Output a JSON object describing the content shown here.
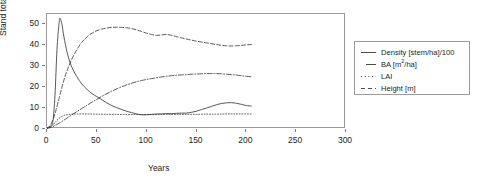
{
  "chart_data": {
    "type": "line",
    "title": "",
    "xlabel": "Years",
    "ylabel": "Stand totals",
    "xlim": [
      0,
      300
    ],
    "ylim": [
      0,
      55
    ],
    "grid": false,
    "legend_position": "right-outside",
    "xticks": [
      0,
      50,
      100,
      150,
      200,
      250,
      300
    ],
    "yticks": [
      0,
      10,
      20,
      30,
      40,
      50
    ],
    "series": [
      {
        "name": "Density [stem/ha]/100",
        "key": "density",
        "style": "solid",
        "color": "#3a3a3a",
        "x": [
          0,
          2,
          4,
          6,
          8,
          10,
          12,
          13,
          15,
          17,
          20,
          23,
          26,
          30,
          35,
          40,
          45,
          50,
          55,
          60,
          65,
          70,
          75,
          80,
          85,
          90,
          95,
          100,
          105,
          110,
          115,
          120,
          125,
          130,
          135,
          140,
          145,
          150,
          155,
          160,
          165,
          170,
          175,
          180,
          185,
          190,
          195,
          200,
          205
        ],
        "y": [
          0.5,
          1.0,
          1.5,
          4.0,
          16.0,
          38.0,
          50.0,
          53.0,
          50.0,
          44.0,
          37.0,
          32.0,
          28.5,
          25.0,
          21.5,
          19.0,
          17.0,
          15.5,
          14.0,
          12.5,
          11.2,
          10.2,
          9.3,
          8.5,
          7.8,
          7.2,
          6.8,
          6.8,
          7.0,
          7.2,
          7.2,
          7.4,
          7.3,
          7.5,
          7.6,
          7.6,
          8.0,
          8.5,
          9.3,
          10.0,
          10.8,
          11.6,
          12.2,
          12.5,
          12.6,
          12.3,
          11.8,
          11.2,
          11.0
        ]
      },
      {
        "name": "BA [m2/ha]",
        "key": "ba",
        "style": "dashdot",
        "color": "#3a3a3a",
        "x": [
          0,
          5,
          10,
          15,
          20,
          25,
          30,
          35,
          40,
          45,
          50,
          55,
          60,
          65,
          70,
          75,
          80,
          85,
          90,
          95,
          100,
          105,
          110,
          115,
          120,
          125,
          130,
          135,
          140,
          145,
          150,
          155,
          160,
          165,
          170,
          175,
          180,
          185,
          190,
          195,
          200,
          205
        ],
        "y": [
          0.2,
          1.0,
          2.2,
          3.6,
          5.2,
          6.8,
          8.3,
          9.8,
          11.3,
          12.8,
          14.2,
          15.6,
          16.9,
          18.1,
          19.2,
          20.2,
          21.1,
          21.9,
          22.6,
          23.2,
          23.7,
          24.1,
          24.5,
          24.9,
          25.2,
          25.5,
          25.7,
          25.9,
          26.0,
          26.2,
          26.3,
          26.4,
          26.5,
          26.5,
          26.5,
          26.4,
          26.2,
          26.0,
          25.8,
          25.5,
          25.2,
          25.0
        ]
      },
      {
        "name": "LAI",
        "key": "lai",
        "style": "dotted",
        "color": "#3a3a3a",
        "x": [
          0,
          3,
          6,
          9,
          12,
          15,
          18,
          21,
          25,
          30,
          40,
          50,
          60,
          70,
          80,
          90,
          100,
          110,
          120,
          130,
          140,
          150,
          160,
          170,
          180,
          190,
          200,
          205
        ],
        "y": [
          0.2,
          0.8,
          2.0,
          3.6,
          5.0,
          6.0,
          6.6,
          6.9,
          7.1,
          7.2,
          7.2,
          7.1,
          7.0,
          7.0,
          6.9,
          6.9,
          6.9,
          6.9,
          7.0,
          7.0,
          7.0,
          7.0,
          7.1,
          7.1,
          7.2,
          7.2,
          7.2,
          7.2
        ]
      },
      {
        "name": "Height [m]",
        "key": "height",
        "style": "dashed",
        "color": "#3a3a3a",
        "x": [
          0,
          3,
          6,
          9,
          12,
          15,
          18,
          21,
          25,
          30,
          35,
          40,
          45,
          50,
          55,
          60,
          65,
          70,
          75,
          80,
          85,
          90,
          95,
          100,
          105,
          110,
          115,
          120,
          125,
          130,
          135,
          140,
          145,
          150,
          155,
          160,
          165,
          170,
          175,
          180,
          185,
          190,
          195,
          200,
          205
        ],
        "y": [
          0.2,
          1.5,
          4.5,
          9.0,
          14.5,
          20.0,
          25.0,
          29.0,
          33.5,
          38.0,
          41.5,
          44.0,
          45.8,
          47.0,
          47.8,
          48.3,
          48.6,
          48.7,
          48.6,
          48.4,
          48.0,
          47.4,
          46.6,
          45.8,
          45.2,
          44.8,
          45.0,
          45.2,
          44.8,
          44.2,
          43.6,
          43.0,
          42.5,
          42.0,
          41.6,
          41.2,
          40.8,
          40.4,
          40.0,
          39.8,
          39.7,
          39.8,
          40.0,
          40.2,
          40.4
        ]
      }
    ]
  },
  "axes": {
    "y_title": "Stand totals",
    "x_title": "Years",
    "y_tick_labels": [
      "0",
      "10",
      "20",
      "30",
      "40",
      "50"
    ],
    "x_tick_labels": [
      "0",
      "50",
      "100",
      "150",
      "200",
      "250",
      "300"
    ]
  },
  "legend": {
    "items": [
      {
        "label": "Density [stem/ha]/100",
        "style": "solid",
        "sup": ""
      },
      {
        "label_pre": "BA [m",
        "sup": "2",
        "label_post": "/ha]",
        "style": "dashed2",
        "label": "BA [m2/ha]"
      },
      {
        "label": "LAI",
        "style": "dotted",
        "sup": ""
      },
      {
        "label": "Height [m]",
        "style": "dash",
        "sup": ""
      }
    ]
  }
}
